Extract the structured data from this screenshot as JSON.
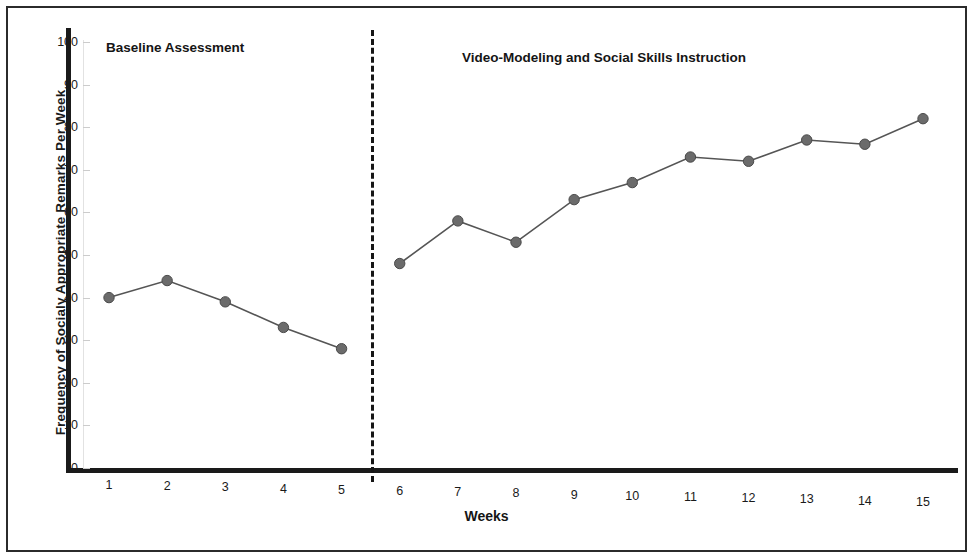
{
  "chart_data": {
    "type": "line",
    "title": "",
    "xlabel": "Weeks",
    "ylabel": "Frequency of Socialy Appropriate Remarks Per Week",
    "categories": [
      1,
      2,
      3,
      4,
      5,
      6,
      7,
      8,
      9,
      10,
      11,
      12,
      13,
      14,
      15
    ],
    "x_tick_labels": [
      "1",
      "2",
      "3",
      "4",
      "5",
      "6",
      "7",
      "8",
      "9",
      "10",
      "11",
      "12",
      "13",
      "14",
      "15"
    ],
    "y_tick_labels": [
      "100",
      "90",
      "80",
      "70",
      "60",
      "50",
      "40",
      "30",
      "20",
      "10",
      "0"
    ],
    "y_tick_values": [
      100,
      90,
      80,
      70,
      60,
      50,
      40,
      30,
      20,
      10,
      0
    ],
    "ylim": [
      0,
      100
    ],
    "xlim": [
      0.5,
      15.5
    ],
    "grid": false,
    "legend": "none",
    "series": [
      {
        "name": "Frequency of socially appropriate remarks",
        "values": [
          40,
          44,
          39,
          33,
          28,
          48,
          58,
          53,
          63,
          67,
          73,
          72,
          77,
          76,
          82
        ],
        "marker": "circle",
        "marker_color": "#6b6b6b",
        "line_color": "#555555"
      }
    ],
    "phases": [
      {
        "label": "Baseline Assessment",
        "weeks": [
          1,
          2,
          3,
          4,
          5
        ]
      },
      {
        "label": "Video-Modeling and Social Skills Instruction",
        "weeks": [
          6,
          7,
          8,
          9,
          10,
          11,
          12,
          13,
          14,
          15
        ]
      }
    ],
    "phase_line": {
      "between_weeks": [
        5,
        6
      ],
      "style": "dashed",
      "color": "#161616"
    },
    "colors": {
      "axis": "#1a1a1a",
      "text": "#151515",
      "marker": "#6b6b6b",
      "line": "#555555",
      "border": "#2b2b2b"
    }
  },
  "axes": {
    "y_title": "Frequency of Socialy Appropriate Remarks Per Week",
    "x_title": "Weeks"
  },
  "captions": {
    "baseline": "Baseline Assessment",
    "intervention": "Video-Modeling and Social Skills Instruction"
  }
}
